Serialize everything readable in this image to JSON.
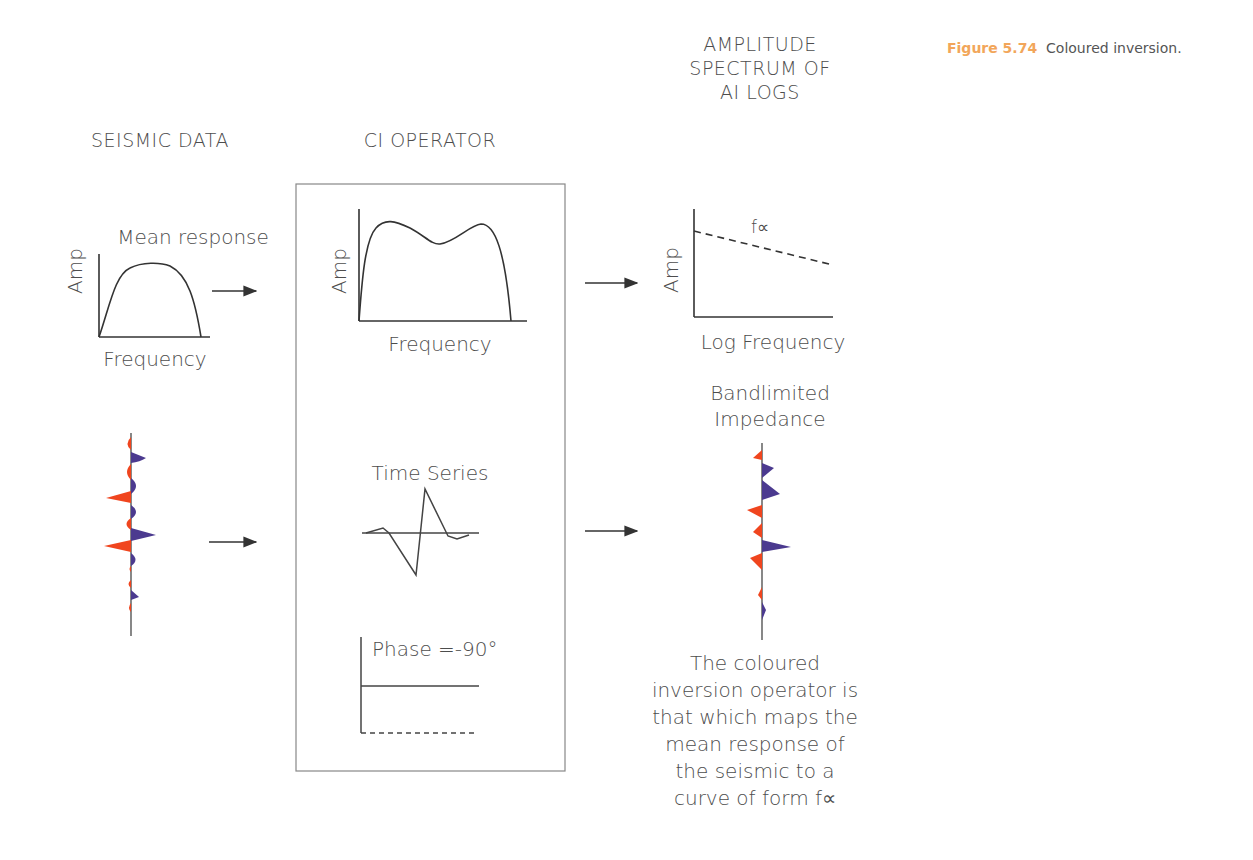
{
  "caption": {
    "figure_number": "Figure 5.74",
    "text": "Coloured inversion."
  },
  "columns": {
    "seismic": {
      "title": "SEISMIC DATA",
      "plot_label": "Mean response",
      "y_label": "Amp",
      "x_label": "Frequency"
    },
    "operator": {
      "title": "CI OPERATOR",
      "y_label": "Amp",
      "x_label": "Frequency",
      "time_series_label": "Time Series",
      "phase_label": "Phase =-90°"
    },
    "spectrum": {
      "title_lines": [
        "AMPLITUDE",
        "SPECTRUM OF",
        "AI LOGS"
      ],
      "y_label": "Amp",
      "x_label": "Log Frequency",
      "curve_label": "f∝",
      "trace_label_lines": [
        "Bandlimited",
        "Impedance"
      ]
    }
  },
  "description_lines": [
    "The coloured",
    "inversion operator is",
    "that which maps the",
    "mean response of",
    "the seismic to a",
    "curve of form f∝"
  ],
  "colors": {
    "negative_lobe": "#f0451e",
    "positive_lobe": "#4b3a8f",
    "line": "#444444",
    "caption_number": "#f2a65a"
  }
}
